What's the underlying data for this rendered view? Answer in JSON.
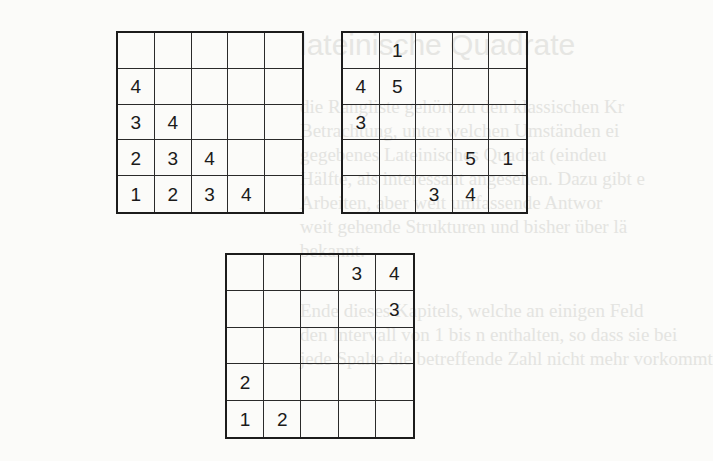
{
  "page": {
    "background": "#fbfbf9",
    "ink": "#1a1a1a"
  },
  "ghost_text": {
    "title": "lateinische Quadrate",
    "lines": [
      "die Rangliste gehört zu den klassischen Kr",
      "Betrachtung, unter welchen Umständen ei",
      "gegebenes Lateinisches Quadrat (eindeu",
      "Hälfte, als interessant angesehen. Dazu gibt e",
      "Arbeiten, aber weit umfassende Antwor",
      "weit gehende Strukturen und bisher über lä",
      "bekannt.",
      "Ende dieses Kapitels, welche an einigen Feld",
      "den Intervall von 1 bis n enthalten, so dass sie bei",
      "jede Spalte die betreffende Zahl nicht mehr vorkommt"
    ]
  },
  "grids": [
    {
      "id": "grid-1",
      "size": 5,
      "rows": [
        [
          "",
          "",
          "",
          "",
          ""
        ],
        [
          "4",
          "",
          "",
          "",
          ""
        ],
        [
          "3",
          "4",
          "",
          "",
          ""
        ],
        [
          "2",
          "3",
          "4",
          "",
          ""
        ],
        [
          "1",
          "2",
          "3",
          "4",
          ""
        ]
      ]
    },
    {
      "id": "grid-2",
      "size": 5,
      "rows": [
        [
          "",
          "1",
          "",
          "",
          ""
        ],
        [
          "4",
          "5",
          "",
          "",
          ""
        ],
        [
          "3",
          "",
          "",
          "",
          ""
        ],
        [
          "",
          "",
          "",
          "5",
          "1"
        ],
        [
          "",
          "",
          "3",
          "4",
          ""
        ]
      ]
    },
    {
      "id": "grid-3",
      "size": 5,
      "rows": [
        [
          "",
          "",
          "",
          "3",
          "4"
        ],
        [
          "",
          "",
          "",
          "",
          "3"
        ],
        [
          "",
          "",
          "",
          "",
          ""
        ],
        [
          "2",
          "",
          "",
          "",
          ""
        ],
        [
          "1",
          "2",
          "",
          "",
          ""
        ]
      ]
    }
  ]
}
